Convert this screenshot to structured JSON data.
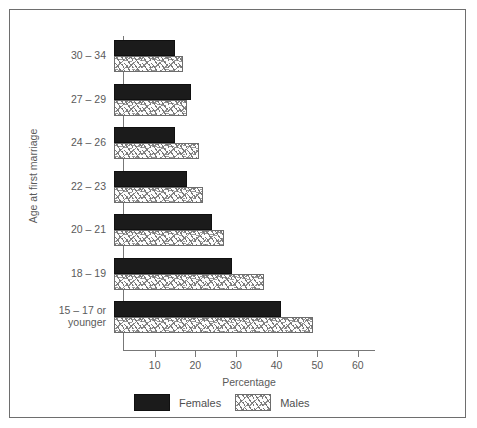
{
  "figure": {
    "top_caption": "",
    "legend": [
      {
        "key": "female",
        "label": "Females",
        "color": "#1b1b1b",
        "pattern": "solid-black"
      },
      {
        "key": "male",
        "label": "Males",
        "color": "#ffffff",
        "pattern": "stipple-dash"
      }
    ]
  },
  "chart_data": {
    "type": "bar",
    "orientation": "horizontal",
    "title": "",
    "xlabel": "Percentage",
    "ylabel": "Age at first marriage",
    "xlim": [
      0,
      62
    ],
    "xticks": [
      10,
      20,
      30,
      40,
      50,
      60
    ],
    "xtick_labels": [
      "10",
      "20",
      "30",
      "40",
      "50",
      "60"
    ],
    "grid": false,
    "legend_position": "below-axes",
    "categories": [
      "30 – 34",
      "27 – 29",
      "24 – 26",
      "22 – 23",
      "20 – 21",
      "18 – 19",
      "15 – 17 or younger"
    ],
    "category_lines": [
      [
        "30 – 34"
      ],
      [
        "27 – 29"
      ],
      [
        "24 – 26"
      ],
      [
        "22 – 23"
      ],
      [
        "20 – 21"
      ],
      [
        "18 – 19"
      ],
      [
        "15 – 17 or",
        "younger"
      ]
    ],
    "series": [
      {
        "name": "Females",
        "values": [
          15,
          19,
          15,
          18,
          24,
          29,
          41
        ]
      },
      {
        "name": "Males",
        "values": [
          17,
          18,
          21,
          22,
          27,
          37,
          49
        ]
      }
    ]
  }
}
